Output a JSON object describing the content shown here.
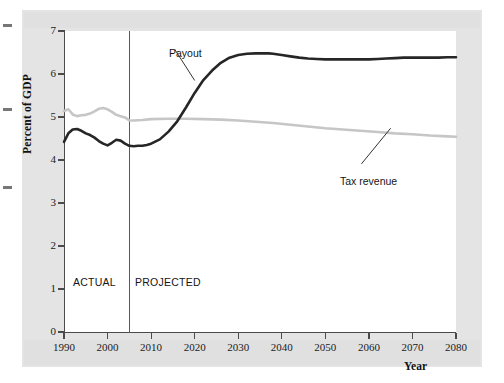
{
  "figure": {
    "background_color": "#e4e4e4",
    "plot_background_color": "#ffffff"
  },
  "annotations": {
    "actual_label": "ACTUAL",
    "projected_label": "PROJECTED",
    "payout_label": "Payout",
    "tax_revenue_label": "Tax revenue"
  },
  "chart_data": {
    "type": "line",
    "title": "",
    "subtitle": "",
    "xlabel": "Year",
    "ylabel": "Percent of GDP",
    "xlim": [
      1990,
      2080
    ],
    "ylim": [
      0,
      7
    ],
    "grid": false,
    "legend_position": "inline-annotation",
    "xticks": [
      1990,
      2000,
      2010,
      2020,
      2030,
      2040,
      2050,
      2060,
      2070,
      2080
    ],
    "xtick_labels": [
      "1990",
      "2000",
      "2010",
      "2020",
      "2030",
      "2040",
      "2050",
      "2060",
      "2070",
      "2080"
    ],
    "yticks": [
      0,
      1,
      2,
      3,
      4,
      5,
      6,
      7
    ],
    "ytick_labels": [
      "0",
      "1",
      "2",
      "3",
      "4",
      "5",
      "6",
      "7"
    ],
    "annotations": [
      {
        "text": "ACTUAL",
        "x": 1996,
        "y": 1.45
      },
      {
        "text": "PROJECTED",
        "x": 2011,
        "y": 1.45
      },
      {
        "text": "Payout",
        "x": 2014,
        "y": 6.72,
        "points_to": [
          2020,
          5.85
        ]
      },
      {
        "text": "Tax revenue",
        "x": 2056,
        "y": 4.05,
        "points_to": [
          2065,
          4.74
        ]
      }
    ],
    "divider_year": 2005,
    "divider_note": "boundary between ACTUAL and PROJECTED",
    "series": [
      {
        "name": "Payout",
        "color": "#262626",
        "x": [
          1990,
          1991,
          1992,
          1993,
          1994,
          1995,
          1996,
          1997,
          1998,
          1999,
          2000,
          2001,
          2002,
          2003,
          2004,
          2005,
          2006,
          2007,
          2008,
          2009,
          2010,
          2012,
          2014,
          2016,
          2018,
          2020,
          2022,
          2024,
          2026,
          2028,
          2030,
          2032,
          2034,
          2036,
          2037,
          2038,
          2040,
          2042,
          2044,
          2046,
          2048,
          2050,
          2052,
          2054,
          2056,
          2058,
          2060,
          2062,
          2064,
          2066,
          2068,
          2070,
          2072,
          2074,
          2076,
          2078,
          2080
        ],
        "values": [
          4.42,
          4.62,
          4.71,
          4.72,
          4.68,
          4.62,
          4.58,
          4.52,
          4.44,
          4.38,
          4.34,
          4.4,
          4.47,
          4.45,
          4.38,
          4.33,
          4.32,
          4.33,
          4.33,
          4.35,
          4.38,
          4.48,
          4.66,
          4.9,
          5.22,
          5.56,
          5.86,
          6.08,
          6.26,
          6.38,
          6.44,
          6.47,
          6.48,
          6.48,
          6.48,
          6.47,
          6.44,
          6.41,
          6.38,
          6.36,
          6.35,
          6.34,
          6.34,
          6.34,
          6.34,
          6.34,
          6.34,
          6.35,
          6.36,
          6.37,
          6.38,
          6.38,
          6.38,
          6.38,
          6.38,
          6.39,
          6.39
        ]
      },
      {
        "name": "Tax revenue",
        "color": "#c6c6c6",
        "x": [
          1990,
          1991,
          1992,
          1993,
          1994,
          1995,
          1996,
          1997,
          1998,
          1999,
          2000,
          2001,
          2002,
          2003,
          2004,
          2005,
          2006,
          2008,
          2010,
          2014,
          2018,
          2022,
          2026,
          2030,
          2034,
          2038,
          2042,
          2046,
          2050,
          2054,
          2058,
          2062,
          2066,
          2070,
          2074,
          2078,
          2080
        ],
        "values": [
          5.14,
          5.18,
          5.06,
          5.02,
          5.04,
          5.05,
          5.08,
          5.13,
          5.19,
          5.21,
          5.18,
          5.12,
          5.05,
          5.02,
          4.99,
          4.92,
          4.92,
          4.93,
          4.95,
          4.96,
          4.96,
          4.95,
          4.94,
          4.92,
          4.89,
          4.86,
          4.82,
          4.78,
          4.74,
          4.71,
          4.68,
          4.65,
          4.62,
          4.6,
          4.57,
          4.55,
          4.54
        ]
      }
    ]
  }
}
